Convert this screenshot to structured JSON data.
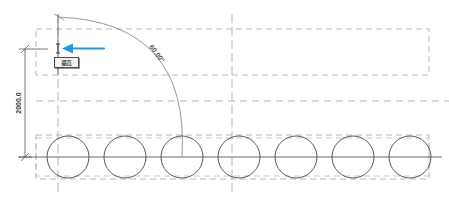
{
  "drawing": {
    "title": "CAD linear array with angular dimension",
    "background_color": "#ffffff",
    "geometry_color": "#5a5a5a",
    "dashed_color": "#9a9a9a",
    "dimension_color": "#333333",
    "cursor_arrow_color": "#1f9bde"
  },
  "dimensions": {
    "vertical_label": "2000.0",
    "angle_label": "60.00°"
  },
  "tooltip": {
    "label": "垂直",
    "name": "snap-tooltip"
  },
  "icons": {
    "cursor_arrow": "left-arrow-pointer-icon",
    "snap_marker": "vertical-snap-marker-icon"
  },
  "circles": {
    "count": 7,
    "radius": 21,
    "centers_x": [
      68,
      125,
      182,
      239,
      296,
      353,
      410
    ],
    "center_y": 157
  },
  "annotations": {
    "arc_start": "top-left-origin",
    "arc_end": "third-circle-center"
  }
}
